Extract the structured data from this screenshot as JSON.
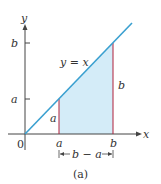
{
  "figure": {
    "caption": "(a)",
    "line_label": "y = x",
    "origin_label": "0",
    "x_axis_label": "x",
    "y_axis_label": "y",
    "x_tick_a": "a",
    "x_tick_b": "b",
    "y_tick_a": "a",
    "y_tick_b": "b",
    "side_a_label": "a",
    "side_b_label": "b",
    "width_label": "b − a",
    "colors": {
      "line": "#3aa0d0",
      "fill": "#d4ecf8",
      "verticals": "#b0203a",
      "axes": "#444444"
    }
  }
}
